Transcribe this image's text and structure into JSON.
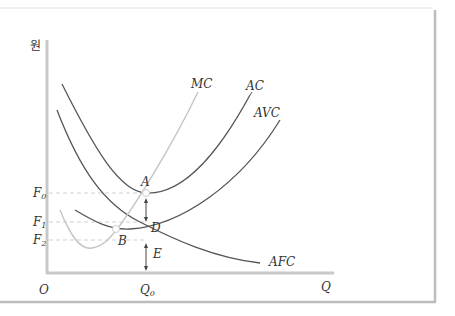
{
  "diagram": {
    "y_axis_label": "원",
    "x_axis_label": "Q",
    "origin_label": "O",
    "x_ticks": [
      {
        "label": "Q",
        "sub": "0",
        "x": 146
      }
    ],
    "y_ticks": [
      {
        "label": "F",
        "sub": "0",
        "y": 193
      },
      {
        "label": "F",
        "sub": "1",
        "y": 222
      },
      {
        "label": "F",
        "sub": "2",
        "y": 240
      }
    ],
    "curves": [
      {
        "name": "MC",
        "label": "MC",
        "color": "#bdbdbd"
      },
      {
        "name": "AC",
        "label": "AC",
        "color": "#555555"
      },
      {
        "name": "AVC",
        "label": "AVC",
        "color": "#555555"
      },
      {
        "name": "AFC",
        "label": "AFC",
        "color": "#555555"
      }
    ],
    "points": [
      {
        "name": "A",
        "label": "A"
      },
      {
        "name": "B",
        "label": "B"
      },
      {
        "name": "D",
        "label": "D"
      },
      {
        "name": "E",
        "label": "E"
      }
    ],
    "colors": {
      "axis": "#c8c8c8",
      "frame": "#bfbfbf",
      "guide": "#cfcfcf",
      "curve": "#555555",
      "mc": "#c0c0c0",
      "text": "#333333"
    }
  }
}
